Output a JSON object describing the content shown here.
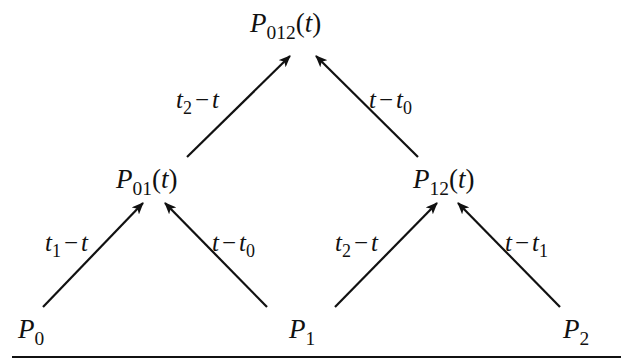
{
  "diagram": {
    "type": "tree",
    "nodes": {
      "root": {
        "symbol": "P",
        "subscript": "012",
        "arg": "t"
      },
      "mid_left": {
        "symbol": "P",
        "subscript": "01",
        "arg": "t"
      },
      "mid_right": {
        "symbol": "P",
        "subscript": "12",
        "arg": "t"
      },
      "leaf_0": {
        "symbol": "P",
        "subscript": "0"
      },
      "leaf_1": {
        "symbol": "P",
        "subscript": "1"
      },
      "leaf_2": {
        "symbol": "P",
        "subscript": "2"
      }
    },
    "edges": [
      {
        "from": "mid_left",
        "to": "root",
        "label": {
          "a": "t",
          "a_sub": "2",
          "op": "−",
          "b": "t",
          "b_sub": ""
        }
      },
      {
        "from": "mid_right",
        "to": "root",
        "label": {
          "a": "t",
          "a_sub": "",
          "op": "−",
          "b": "t",
          "b_sub": "0"
        }
      },
      {
        "from": "leaf_0",
        "to": "mid_left",
        "label": {
          "a": "t",
          "a_sub": "1",
          "op": "−",
          "b": "t",
          "b_sub": ""
        }
      },
      {
        "from": "leaf_1",
        "to": "mid_left",
        "label": {
          "a": "t",
          "a_sub": "",
          "op": "−",
          "b": "t",
          "b_sub": "0"
        }
      },
      {
        "from": "leaf_1",
        "to": "mid_right",
        "label": {
          "a": "t",
          "a_sub": "2",
          "op": "−",
          "b": "t",
          "b_sub": ""
        }
      },
      {
        "from": "leaf_2",
        "to": "mid_right",
        "label": {
          "a": "t",
          "a_sub": "",
          "op": "−",
          "b": "t",
          "b_sub": "1"
        }
      }
    ],
    "paren_open": "(",
    "paren_close": ")",
    "line_color": "#111111"
  }
}
